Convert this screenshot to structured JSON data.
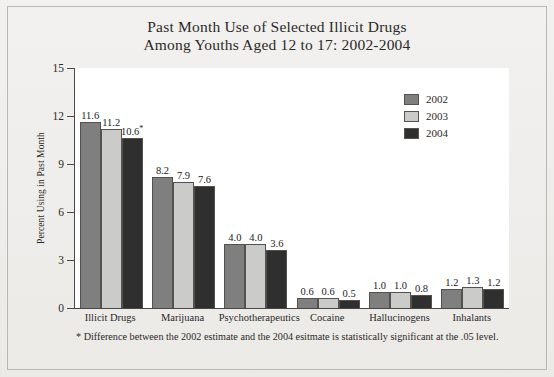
{
  "chart_data": {
    "type": "bar",
    "title": "Past Month Use of Selected Illicit Drugs Among Youths Aged 12 to 17: 2002-2004",
    "title_lines": [
      "Past Month Use of Selected Illicit Drugs",
      "Among Youths Aged 12 to 17: 2002-2004"
    ],
    "xlabel": "",
    "ylabel": "Percent Using in Past Month",
    "ylim": [
      0,
      15
    ],
    "yticks": [
      0,
      3,
      6,
      9,
      12,
      15
    ],
    "ytick_labels": [
      "0",
      "3",
      "6",
      "9",
      "12",
      "15"
    ],
    "grid": false,
    "legend_position": "top-right",
    "categories": [
      "Illicit Drugs",
      "Marijuana",
      "Psychotherapeutics",
      "Cocaine",
      "Hallucinogens",
      "Inhalants"
    ],
    "series": [
      {
        "name": "2002",
        "color": "#7f7f7f",
        "values": [
          11.6,
          8.2,
          4.0,
          0.6,
          1.0,
          1.2
        ],
        "labels": [
          "11.6",
          "8.2",
          "4.0",
          "0.6",
          "1.0",
          "1.2"
        ]
      },
      {
        "name": "2003",
        "color": "#cbcbc9",
        "values": [
          11.2,
          7.9,
          4.0,
          0.6,
          1.0,
          1.3
        ],
        "labels": [
          "11.2",
          "7.9",
          "4.0",
          "0.6",
          "1.0",
          "1.3"
        ]
      },
      {
        "name": "2004",
        "color": "#2f2f2f",
        "values": [
          10.6,
          7.6,
          3.6,
          0.5,
          0.8,
          1.2
        ],
        "labels": [
          "10.6",
          "7.6",
          "3.6",
          "0.5",
          "0.8",
          "1.2"
        ],
        "significance_marker": [
          "*",
          "",
          "",
          "",
          "",
          ""
        ]
      }
    ],
    "annotations": [
      "* Difference between the 2002 estimate and the 2004 esitmate is statistically significant at the .05 level."
    ],
    "footnote": "* Difference between the 2002 estimate and the 2004 esitmate is statistically significant at the .05 level."
  }
}
